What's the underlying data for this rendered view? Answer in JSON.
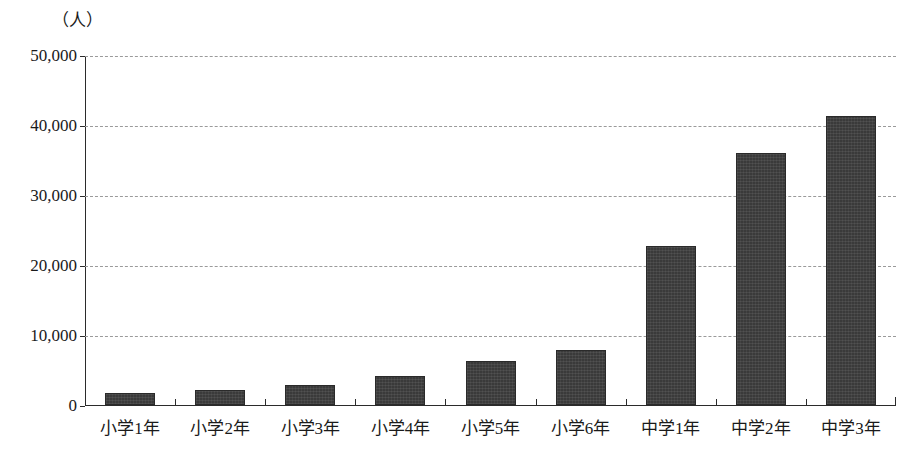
{
  "chart_data": {
    "type": "bar",
    "title": "",
    "subtitle": "",
    "xlabel": "",
    "ylabel": "",
    "unit_label": "（人）",
    "categories": [
      "小学1年",
      "小学2年",
      "小学3年",
      "小学4年",
      "小学5年",
      "小学6年",
      "中学1年",
      "中学2年",
      "中学3年"
    ],
    "values": [
      1700,
      2200,
      2900,
      4200,
      6300,
      7800,
      22700,
      36000,
      41300
    ],
    "ylim": [
      0,
      50000
    ],
    "ytick_values": [
      0,
      10000,
      20000,
      30000,
      40000,
      50000
    ],
    "ytick_labels": [
      "0",
      "10,000",
      "20,000",
      "30,000",
      "40,000",
      "50,000"
    ],
    "grid": true,
    "grid_style": "dashed",
    "legend": false,
    "legend_position": "none",
    "bar_color": "#3a3a3a",
    "grid_color": "#9a9a9a",
    "axis_color": "#2b2b2b",
    "background_color": "#ffffff"
  }
}
